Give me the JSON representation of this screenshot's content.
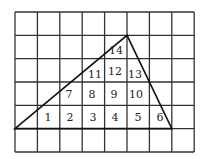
{
  "diagram": {
    "grid": {
      "columns": 8,
      "rows": 6,
      "left": 15,
      "top": 12,
      "cell_w": 22.4,
      "cell_h": 23.33,
      "line_color": "#333333"
    },
    "triangle": {
      "vertices": [
        [
          15,
          128.6
        ],
        [
          127,
          35.3
        ],
        [
          171.8,
          128.6
        ]
      ],
      "stroke": "#111111"
    },
    "labels": [
      {
        "text": "1",
        "x": 48,
        "y": 121
      },
      {
        "text": "2",
        "x": 70,
        "y": 121
      },
      {
        "text": "3",
        "x": 93,
        "y": 121
      },
      {
        "text": "4",
        "x": 115,
        "y": 121
      },
      {
        "text": "5",
        "x": 138,
        "y": 121
      },
      {
        "text": "6",
        "x": 160,
        "y": 121
      },
      {
        "text": "7",
        "x": 69,
        "y": 98
      },
      {
        "text": "8",
        "x": 92,
        "y": 98
      },
      {
        "text": "9",
        "x": 114,
        "y": 98
      },
      {
        "text": "10",
        "x": 136,
        "y": 98
      },
      {
        "text": "11",
        "x": 95,
        "y": 78
      },
      {
        "text": "12",
        "x": 115,
        "y": 75
      },
      {
        "text": "13",
        "x": 135,
        "y": 78
      },
      {
        "text": "14",
        "x": 116,
        "y": 54
      }
    ]
  }
}
